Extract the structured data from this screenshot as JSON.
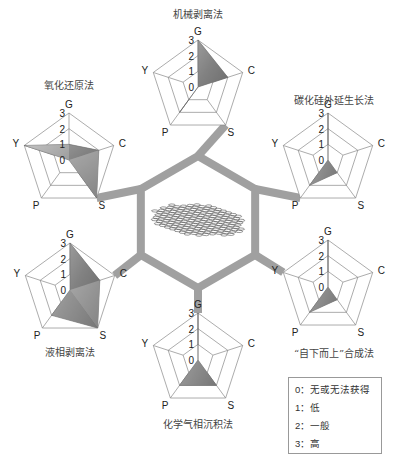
{
  "axes": [
    "G",
    "C",
    "S",
    "P",
    "Y"
  ],
  "levels": [
    "0",
    "1",
    "2",
    "3"
  ],
  "colors": {
    "connector": "#a0a0a0",
    "grid": "#888888",
    "fill_light": "#d0d0d0",
    "fill_dark": "#555555",
    "text": "#222222"
  },
  "center": {
    "label": "graphene-lattice",
    "hexagon": {
      "cx": 198,
      "cy": 222,
      "r": 66
    }
  },
  "charts": [
    {
      "id": "mechanical",
      "title": "机械剥离法",
      "cx": 198,
      "cy": 87,
      "r": 47,
      "title_pos": [
        198,
        18
      ],
      "values": {
        "G": 3,
        "C": 2,
        "S": 0,
        "P": 2,
        "Y": 0
      },
      "connector_axis": "S"
    },
    {
      "id": "sic-epitaxy",
      "title": "碳化硅外延生长法",
      "cx": 328,
      "cy": 160,
      "r": 47,
      "title_pos": [
        334,
        104
      ],
      "values": {
        "G": 3,
        "C": 0,
        "S": 1,
        "P": 2,
        "Y": 0
      },
      "connector_axis": "P"
    },
    {
      "id": "bottom-up",
      "title": "“自下而上”合成法",
      "cx": 328,
      "cy": 287,
      "r": 47,
      "title_pos": [
        334,
        357
      ],
      "values": {
        "G": 3,
        "C": 0,
        "S": 1,
        "P": 2,
        "Y": 0
      },
      "connector_axis": "Y"
    },
    {
      "id": "cvd",
      "title": "化学气相沉积法",
      "cx": 198,
      "cy": 360,
      "r": 47,
      "title_pos": [
        198,
        428
      ],
      "values": {
        "G": 3,
        "C": 0,
        "S": 2,
        "P": 2,
        "Y": 0
      },
      "connector_axis": "G"
    },
    {
      "id": "liquid-phase",
      "title": "液相剥离法",
      "cx": 70,
      "cy": 290,
      "r": 47,
      "title_pos": [
        70,
        356
      ],
      "values": {
        "G": 3,
        "C": 2,
        "S": 3,
        "P": 2,
        "Y": 0
      },
      "connector_axis": "C"
    },
    {
      "id": "redox",
      "title": "氧化还原法",
      "cx": 69,
      "cy": 160,
      "r": 47,
      "title_pos": [
        69,
        89
      ],
      "values": {
        "G": 1,
        "C": 2,
        "S": 3,
        "P": 0,
        "Y": 3
      },
      "connector_axis": "S"
    }
  ],
  "legend": {
    "items": [
      {
        "key": "0",
        "sep": "：",
        "label": "无或无法获得"
      },
      {
        "key": "1",
        "sep": "：",
        "label": "低"
      },
      {
        "key": "2",
        "sep": "：",
        "label": "一般"
      },
      {
        "key": "3",
        "sep": "：",
        "label": "高"
      }
    ]
  },
  "chart_data": {
    "type": "radar",
    "title": "",
    "axes": [
      "G",
      "C",
      "S",
      "P",
      "Y"
    ],
    "scale": [
      0,
      3
    ],
    "scale_labels": {
      "0": "无或无法获得",
      "1": "低",
      "2": "一般",
      "3": "高"
    },
    "series": [
      {
        "name": "机械剥离法",
        "values": [
          3,
          2,
          0,
          2,
          0
        ]
      },
      {
        "name": "碳化硅外延生长法",
        "values": [
          3,
          0,
          1,
          2,
          0
        ]
      },
      {
        "name": "“自下而上”合成法",
        "values": [
          3,
          0,
          1,
          2,
          0
        ]
      },
      {
        "name": "化学气相沉积法",
        "values": [
          3,
          0,
          2,
          2,
          0
        ]
      },
      {
        "name": "液相剥离法",
        "values": [
          3,
          2,
          3,
          2,
          0
        ]
      },
      {
        "name": "氧化还原法",
        "values": [
          1,
          2,
          3,
          0,
          3
        ]
      }
    ]
  }
}
